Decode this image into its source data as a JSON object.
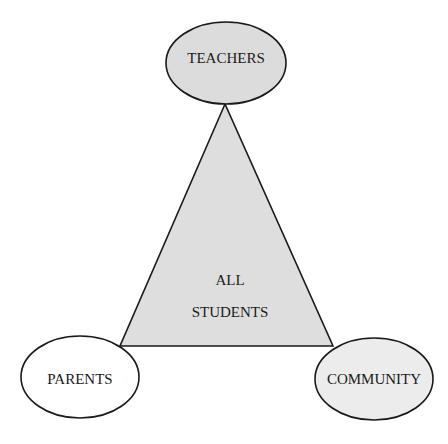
{
  "diagram": {
    "type": "triangle-with-nodes",
    "center": {
      "line1": "ALL",
      "line2": "STUDENTS"
    },
    "nodes": [
      {
        "id": "teachers",
        "label": "TEACHERS",
        "fill": "#dcdcdc"
      },
      {
        "id": "parents",
        "label": "PARENTS",
        "fill": "#ffffff"
      },
      {
        "id": "community",
        "label": "COMMUNITY",
        "fill": "#ececec"
      }
    ],
    "colors": {
      "triangle_fill": "#dedede",
      "stroke": "#1a1a1a"
    }
  }
}
